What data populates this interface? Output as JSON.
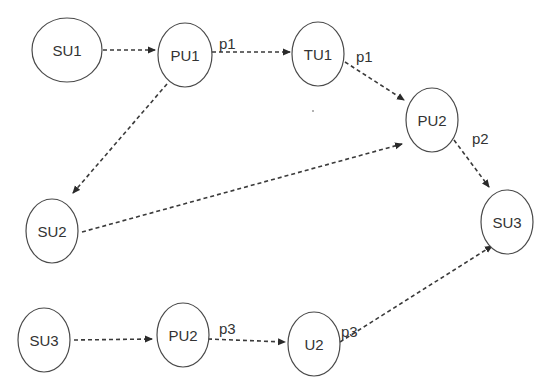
{
  "diagram": {
    "type": "directed-graph",
    "style": {
      "node_stroke": "#4a4a4a",
      "edge_stroke": "#3a3a3a",
      "text_color": "#333333",
      "background": "#ffffff",
      "edge_style": "dashed"
    },
    "nodes": [
      {
        "id": "su1",
        "label": "SU1",
        "cx": 67,
        "cy": 50,
        "rx": 35,
        "ry": 32
      },
      {
        "id": "pu1",
        "label": "PU1",
        "cx": 185,
        "cy": 55,
        "rx": 27,
        "ry": 32
      },
      {
        "id": "tu1",
        "label": "TU1",
        "cx": 318,
        "cy": 54,
        "rx": 26,
        "ry": 32
      },
      {
        "id": "pu2a",
        "label": "PU2",
        "cx": 432,
        "cy": 120,
        "rx": 26,
        "ry": 32
      },
      {
        "id": "su3a",
        "label": "SU3",
        "cx": 507,
        "cy": 222,
        "rx": 26,
        "ry": 32
      },
      {
        "id": "su2",
        "label": "SU2",
        "cx": 52,
        "cy": 231,
        "rx": 26,
        "ry": 32
      },
      {
        "id": "su3b",
        "label": "SU3",
        "cx": 44,
        "cy": 340,
        "rx": 26,
        "ry": 32
      },
      {
        "id": "pu2b",
        "label": "PU2",
        "cx": 183,
        "cy": 335,
        "rx": 26,
        "ry": 32
      },
      {
        "id": "u2",
        "label": "U2",
        "cx": 314,
        "cy": 344,
        "rx": 26,
        "ry": 32
      }
    ],
    "edges": [
      {
        "from": "su1",
        "to": "pu1",
        "label": "",
        "x1": 103,
        "y1": 50,
        "x2": 155,
        "y2": 50
      },
      {
        "from": "pu1",
        "to": "tu1",
        "label": "p1",
        "x1": 212,
        "y1": 52,
        "x2": 290,
        "y2": 52,
        "lx": 219,
        "ly": 49
      },
      {
        "from": "tu1",
        "to": "pu2a",
        "label": "p1",
        "x1": 345,
        "y1": 62,
        "x2": 404,
        "y2": 100,
        "lx": 356,
        "ly": 62
      },
      {
        "from": "pu1",
        "to": "su2",
        "label": "",
        "x1": 167,
        "y1": 84,
        "x2": 73,
        "y2": 193
      },
      {
        "from": "su2",
        "to": "pu2a",
        "label": "",
        "x1": 82,
        "y1": 232,
        "x2": 402,
        "y2": 144
      },
      {
        "from": "pu2a",
        "to": "su3a",
        "label": "p2",
        "x1": 454,
        "y1": 140,
        "x2": 489,
        "y2": 187,
        "lx": 472,
        "ly": 144
      },
      {
        "from": "su3b",
        "to": "pu2b",
        "label": "",
        "x1": 74,
        "y1": 340,
        "x2": 152,
        "y2": 339
      },
      {
        "from": "pu2b",
        "to": "u2",
        "label": "p3",
        "x1": 208,
        "y1": 339,
        "x2": 285,
        "y2": 342,
        "lx": 219,
        "ly": 334
      },
      {
        "from": "u2",
        "to": "su3a",
        "label": "p3",
        "x1": 340,
        "y1": 342,
        "x2": 492,
        "y2": 246,
        "lx": 341,
        "ly": 337
      }
    ]
  }
}
